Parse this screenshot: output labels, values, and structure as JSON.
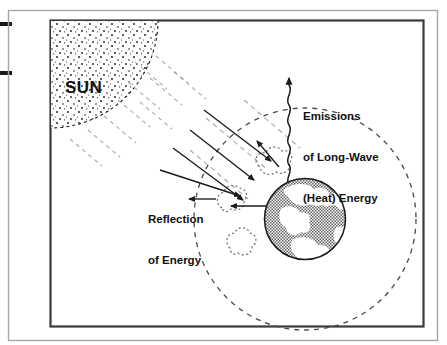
{
  "figure": {
    "kind": "greenhouse-effect-diagram",
    "background_color": "#ffffff",
    "ink_color": "#1a1a1a",
    "ray_color": "#9a9a9a",
    "earth_fill_color": "#7a7a7a",
    "frame": {
      "outer": {
        "x": 8,
        "y": 10,
        "width": 430,
        "height": 331,
        "stroke": "#9b9b9b"
      },
      "inner": {
        "x": 50,
        "y": 20,
        "width": 374,
        "height": 307,
        "stroke": "#3a3a3a"
      }
    },
    "edge_marks": [
      {
        "name": "crop-mark-upper",
        "x": 0,
        "y": 22,
        "width": 12,
        "height": 4
      },
      {
        "name": "crop-mark-lower",
        "x": 0,
        "y": 71,
        "width": 12,
        "height": 4
      }
    ]
  },
  "labels": {
    "sun": "SUN",
    "emissions_line1": "Emissions",
    "emissions_line2": "of Long-Wave",
    "emissions_line3": "(Heat) Energy",
    "reflection_line1": "Reflection",
    "reflection_line2": "of Energy"
  },
  "elements": {
    "sun": {
      "name": "sun-body",
      "center_x": 50,
      "center_y": 20,
      "radius": 108,
      "style": "stippled disc with dashed edge, anchored at inner frame top-left corner"
    },
    "sun_rays": {
      "name": "sun-rays",
      "count": 10,
      "style": "light gray dashed segments radiating down-right from the sun",
      "angle_degrees": 40
    },
    "atmosphere": {
      "name": "atmosphere-boundary",
      "center_x": 305,
      "center_y": 219,
      "radius": 111,
      "style": "dashed circle"
    },
    "earth": {
      "name": "earth-globe",
      "center_x": 305,
      "center_y": 219,
      "radius": 41,
      "style": "halftone gray sphere with white continents"
    },
    "clouds": [
      {
        "name": "cloud-upper",
        "center_x": 272,
        "center_y": 158
      },
      {
        "name": "cloud-middle-left",
        "center_x": 229,
        "center_y": 203
      },
      {
        "name": "cloud-lower-left",
        "center_x": 240,
        "center_y": 243
      }
    ],
    "incoming_rays": {
      "name": "incoming-solar-arrows",
      "count": 4,
      "style": "solid lines with filled triangular arrowheads aimed at the Earth"
    },
    "emission_wave": {
      "name": "long-wave-emission-arrow",
      "style": "vertical wavy line with upward filled arrowhead",
      "from_x": 289,
      "from_y": 184,
      "to_x": 289,
      "to_y": 74
    },
    "reflection_arrows": {
      "name": "reflection-arrows",
      "count": 3,
      "style": "solid lines with filled arrowheads pointing away from Earth and clouds"
    }
  }
}
